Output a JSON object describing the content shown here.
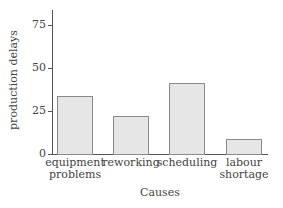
{
  "chart_data": {
    "type": "bar",
    "title": "",
    "xlabel": "Causes",
    "ylabel": "production delays",
    "ylim": [
      0,
      85
    ],
    "yticks": [
      0,
      25,
      50,
      75
    ],
    "categories": [
      "equipment problems",
      "reworking",
      "scheduling",
      "labour shortage"
    ],
    "category_lines": [
      [
        "equipment",
        "problems"
      ],
      [
        "reworking"
      ],
      [
        "scheduling"
      ],
      [
        "labour",
        "shortage"
      ]
    ],
    "values": [
      34,
      22,
      41,
      9
    ],
    "grid": false,
    "legend": null,
    "bar_color": "#e6e6e6",
    "bar_edge_color": "#8a8a8a"
  }
}
